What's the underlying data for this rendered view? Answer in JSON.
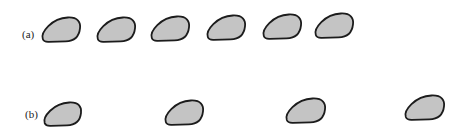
{
  "figure": {
    "rows": [
      {
        "id": "a",
        "label": "(a)",
        "label_x": 22,
        "label_y": 28,
        "blobs": [
          {
            "x": 42,
            "y": 17,
            "w": 38,
            "h": 25
          },
          {
            "x": 97,
            "y": 17,
            "w": 38,
            "h": 25
          },
          {
            "x": 151,
            "y": 16,
            "w": 38,
            "h": 25
          },
          {
            "x": 207,
            "y": 15,
            "w": 38,
            "h": 25
          },
          {
            "x": 263,
            "y": 14,
            "w": 38,
            "h": 25
          },
          {
            "x": 315,
            "y": 13,
            "w": 38,
            "h": 25
          }
        ]
      },
      {
        "id": "b",
        "label": "(b)",
        "label_x": 25,
        "label_y": 108,
        "blobs": [
          {
            "x": 44,
            "y": 102,
            "w": 37,
            "h": 24
          },
          {
            "x": 165,
            "y": 100,
            "w": 38,
            "h": 25
          },
          {
            "x": 286,
            "y": 98,
            "w": 39,
            "h": 25
          },
          {
            "x": 405,
            "y": 95,
            "w": 39,
            "h": 25
          }
        ]
      }
    ],
    "colors": {
      "fill": "#c4c4c4",
      "stroke": "#1c1c1c",
      "background": "#ffffff"
    }
  }
}
